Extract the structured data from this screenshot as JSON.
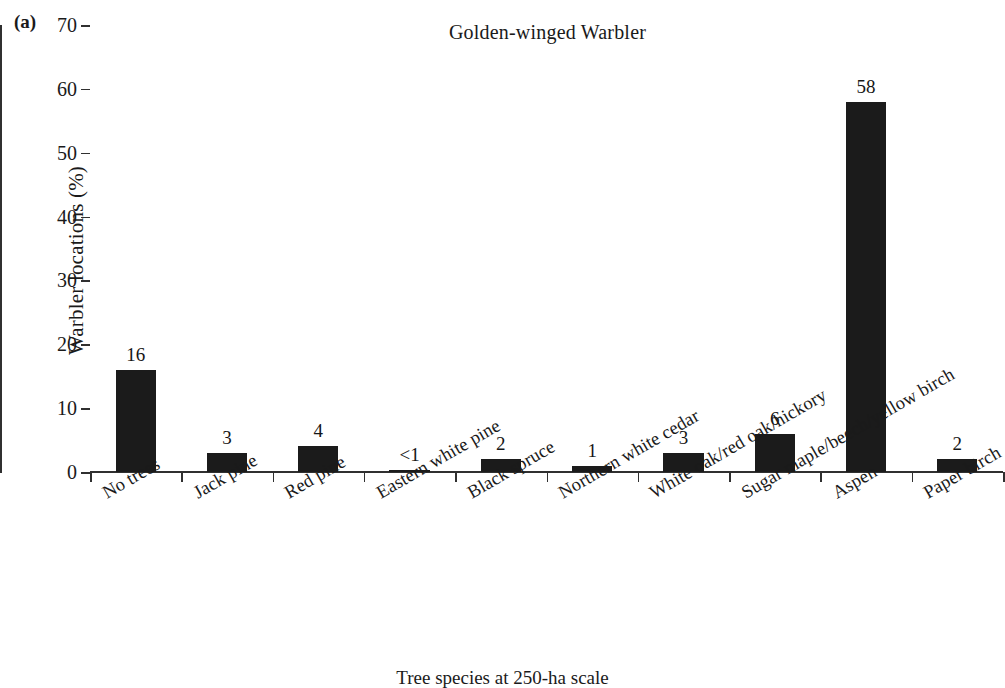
{
  "figure": {
    "panel_letter": "(a)",
    "x_axis_title": "Tree species at 250-ha scale"
  },
  "chart_data": {
    "type": "bar",
    "title": "Golden-winged Warbler",
    "xlabel": "Tree species at 250-ha scale",
    "ylabel": "Warbler locations (%)",
    "ylim": [
      0,
      70
    ],
    "ytick_step": 10,
    "yticks": [
      0,
      10,
      20,
      30,
      40,
      50,
      60,
      70
    ],
    "ytick_labels": [
      "0",
      "10",
      "20",
      "30",
      "40",
      "50",
      "60",
      "70"
    ],
    "grid": false,
    "legend": false,
    "bar_color": "#1b1b1b",
    "xtick_label_rotation": -30,
    "categories": [
      "No trees",
      "Jack pine",
      "Red pine",
      "Eastern white pine",
      "Black spruce",
      "Northern white cedar",
      "White oak/red oak/hickory",
      "Sugar maple/beech/yellow birch",
      "Aspen",
      "Paper birch"
    ],
    "values": [
      16,
      3,
      4,
      0.3,
      2,
      1,
      3,
      6,
      58,
      2
    ],
    "data_labels": [
      "16",
      "3",
      "4",
      "<1",
      "2",
      "1",
      "3",
      "6",
      "58",
      "2"
    ]
  }
}
